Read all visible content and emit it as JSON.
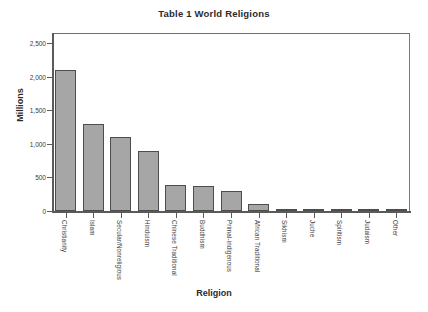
{
  "chart_data": {
    "type": "bar",
    "title": "Table 1 World Religions",
    "xlabel": "Religion",
    "ylabel": "Millions",
    "ylim": [
      0,
      2500
    ],
    "yticks": [
      0,
      500,
      1000,
      1500,
      2000,
      2500
    ],
    "ytick_labels": [
      "0",
      "500",
      "1,000",
      "1,500",
      "2,000",
      "2,500"
    ],
    "grid": false,
    "legend": "none",
    "bar_color": "#a6a6a6",
    "bar_border_color": "#4d4d4d",
    "categories": [
      "Christianity",
      "Islam",
      "Secular/Nonreligious",
      "Hinduism",
      "Chinese Traditional",
      "Buddhism",
      "Primal-indigenous",
      "African Traditional",
      "Sikhism",
      "Juche",
      "Spiritism",
      "Judaism",
      "Other"
    ],
    "values": [
      2100,
      1300,
      1100,
      900,
      394,
      376,
      300,
      100,
      23,
      19,
      15,
      14,
      20
    ]
  }
}
